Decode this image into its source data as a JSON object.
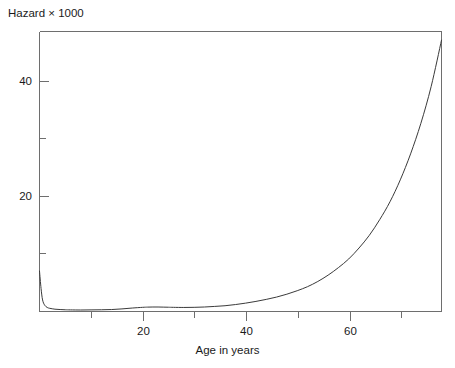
{
  "chart_data": {
    "type": "line",
    "title": "Hazard × 1000",
    "xlabel": "Age in years",
    "ylabel": "",
    "xlim": [
      0,
      78
    ],
    "ylim": [
      0,
      48.5
    ],
    "grid": false,
    "legend": "none",
    "line_color": "#3a3a3a",
    "frame_color": "#6e6e6e",
    "background": "#ffffff",
    "x_ticks_major": [
      20,
      40,
      60
    ],
    "x_ticks_minor": [
      10,
      30,
      50,
      70
    ],
    "x_tick_labels": [
      "20",
      "40",
      "60"
    ],
    "y_ticks_major": [
      20,
      40
    ],
    "y_ticks_minor": [
      10,
      30,
      50
    ],
    "y_tick_labels": [
      "20",
      "40"
    ],
    "series": [
      {
        "name": "Hazard rate per 1000",
        "x": [
          0,
          0.3,
          0.6,
          1,
          1.5,
          2,
          3,
          4,
          5,
          6,
          8,
          10,
          12,
          14,
          16,
          18,
          20,
          21,
          22,
          23,
          24,
          25,
          26,
          28,
          30,
          32,
          34,
          36,
          38,
          40,
          42,
          44,
          46,
          48,
          50,
          52,
          54,
          56,
          58,
          60,
          62,
          64,
          66,
          68,
          70,
          72,
          74,
          76,
          78
        ],
        "y": [
          7.0,
          4.0,
          2.0,
          1.1,
          0.7,
          0.55,
          0.4,
          0.34,
          0.3,
          0.28,
          0.26,
          0.28,
          0.3,
          0.34,
          0.45,
          0.6,
          0.72,
          0.76,
          0.78,
          0.78,
          0.76,
          0.74,
          0.72,
          0.7,
          0.72,
          0.78,
          0.88,
          1.0,
          1.2,
          1.45,
          1.75,
          2.1,
          2.5,
          3.0,
          3.6,
          4.3,
          5.2,
          6.3,
          7.6,
          9.1,
          11.0,
          13.2,
          15.9,
          19.0,
          22.8,
          27.3,
          32.6,
          39.0,
          47.0
        ]
      }
    ],
    "annotations": []
  },
  "axes": {
    "x_tick_label_0": "20",
    "x_tick_label_1": "40",
    "x_tick_label_2": "60",
    "y_tick_label_0": "20",
    "y_tick_label_1": "40"
  }
}
